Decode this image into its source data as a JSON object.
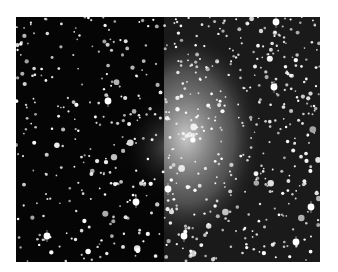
{
  "image": {
    "subject": "star field with diffuse galaxy glow",
    "description": "Monochrome astronomical photograph of a dense star field; right half brighter with a diffuse nebulous glow, sharp vertical seam near center",
    "frame": {
      "x": 16,
      "y": 17,
      "width": 304,
      "height": 245
    },
    "seam_x": 148,
    "colors": {
      "background": "#050505",
      "page": "#ffffff",
      "star": "#ffffff",
      "glow": "#e8e8e8"
    },
    "glow": {
      "cx": 170,
      "cy": 120,
      "rx": 80,
      "ry": 110,
      "opacity": 0.85
    },
    "left_glow": {
      "cx": 150,
      "cy": 130,
      "rx": 45,
      "ry": 55,
      "opacity": 0.35
    },
    "star_seed": 7,
    "star_count_left": 260,
    "star_count_right": 420,
    "bright_stars": [
      {
        "x": 31,
        "y": 219
      },
      {
        "x": 120,
        "y": 185
      },
      {
        "x": 152,
        "y": 172
      },
      {
        "x": 168,
        "y": 219
      },
      {
        "x": 258,
        "y": 70
      },
      {
        "x": 295,
        "y": 190
      },
      {
        "x": 260,
        "y": 5
      },
      {
        "x": 92,
        "y": 84
      },
      {
        "x": 280,
        "y": 225
      }
    ]
  }
}
